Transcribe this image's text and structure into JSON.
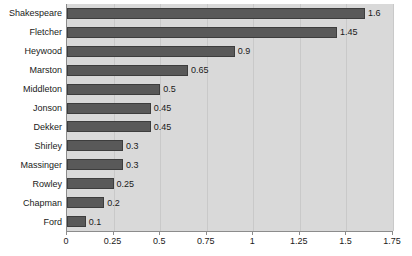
{
  "chart_data": {
    "type": "bar",
    "orientation": "horizontal",
    "title": "",
    "subtitle": "",
    "xlabel": "",
    "ylabel": "",
    "xlim": [
      0,
      1.75
    ],
    "grid": true,
    "legend": false,
    "xticks": [
      "0",
      "0.25",
      "0.5",
      "0.75",
      "1",
      "1.25",
      "1.5",
      "1.75"
    ],
    "xtick_values": [
      0,
      0.25,
      0.5,
      0.75,
      1,
      1.25,
      1.5,
      1.75
    ],
    "categories": [
      "Shakespeare",
      "Fletcher",
      "Heywood",
      "Marston",
      "Middleton",
      "Jonson",
      "Dekker",
      "Shirley",
      "Massinger",
      "Rowley",
      "Chapman",
      "Ford"
    ],
    "values": [
      1.6,
      1.45,
      0.9,
      0.65,
      0.5,
      0.45,
      0.45,
      0.3,
      0.3,
      0.25,
      0.2,
      0.1
    ],
    "value_labels": [
      "1.6",
      "1.45",
      "0.9",
      "0.65",
      "0.5",
      "0.45",
      "0.45",
      "0.3",
      "0.3",
      "0.25",
      "0.2",
      "0.1"
    ],
    "colors": {
      "bar_fill": "#595959",
      "bar_edge": "#3d3d3d",
      "plot_background": "#d9d9d9",
      "figure_background": "#ffffff",
      "gridline": "#c9c9c9",
      "axis_line": "#8c8c8c",
      "text": "#1a1a1a"
    }
  }
}
